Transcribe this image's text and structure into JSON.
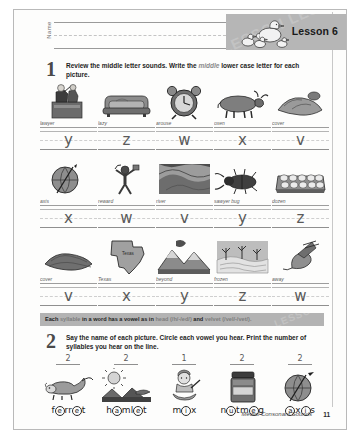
{
  "header": {
    "name_label": "Name",
    "lesson_title": "Lesson 6",
    "banner_watermark": "LESSON LESSON LESSON",
    "duck_icon": "duck-with-ducklings-icon"
  },
  "section1": {
    "number": "1",
    "instruction_prefix": "Review the middle letter sounds. Write the ",
    "instruction_emphasis": "middle",
    "instruction_suffix": " lower case letter for each picture.",
    "rows": [
      {
        "cells": [
          {
            "word": "lawyer",
            "answer": "y",
            "art": "lawyer-icon"
          },
          {
            "word": "lazy",
            "answer": "z",
            "art": "sofa-icon"
          },
          {
            "word": "arouse",
            "answer": "w",
            "art": "alarm-clock-icon"
          },
          {
            "word": "oxen",
            "answer": "x",
            "art": "oxen-icon"
          },
          {
            "word": "cover",
            "answer": "v",
            "art": "cover-icon"
          }
        ]
      },
      {
        "cells": [
          {
            "word": "axis",
            "answer": "x",
            "art": "globe-axis-icon"
          },
          {
            "word": "reward",
            "answer": "w",
            "art": "reward-icon"
          },
          {
            "word": "river",
            "answer": "v",
            "art": "river-icon"
          },
          {
            "word": "sawyer bug",
            "answer": "y",
            "art": "beetle-icon"
          },
          {
            "word": "dozen",
            "answer": "z",
            "art": "egg-carton-icon"
          }
        ]
      },
      {
        "cells": [
          {
            "word": "cover",
            "answer": "v",
            "art": "blanket-icon"
          },
          {
            "word": "Texas",
            "answer": "x",
            "art": "texas-map-icon"
          },
          {
            "word": "beyond",
            "answer": "y",
            "art": "mountains-icon"
          },
          {
            "word": "frozen",
            "answer": "z",
            "art": "frozen-lake-icon"
          },
          {
            "word": "away",
            "answer": "w",
            "art": "bird-flying-away-icon"
          }
        ]
      }
    ]
  },
  "tip": {
    "prefix": "Each ",
    "word1": "syllable",
    "middle": " in a word has a vowel as in ",
    "word2": "head",
    "phon1": " (/h/-/ed/) ",
    "and": "and",
    "word3": " velvet",
    "phon2": " (/vel/-/vet/).",
    "watermark": "LESSON"
  },
  "section2": {
    "number": "2",
    "instruction_line1": "Say the name of each picture. Circle each vowel you hear. Print the number of",
    "instruction_line2": "syllables you hear on the line.",
    "cells": [
      {
        "count": "2",
        "art": "ferret-icon",
        "parts": [
          {
            "t": "f",
            "c": false
          },
          {
            "t": "e",
            "c": true
          },
          {
            "t": "rr",
            "c": false
          },
          {
            "t": "e",
            "c": true
          },
          {
            "t": "t",
            "c": false
          }
        ]
      },
      {
        "count": "2",
        "art": "hamlet-icon",
        "parts": [
          {
            "t": "h",
            "c": false
          },
          {
            "t": "a",
            "c": true
          },
          {
            "t": "m",
            "c": false
          },
          {
            "t": "l",
            "c": false
          },
          {
            "t": "e",
            "c": true
          },
          {
            "t": "t",
            "c": false
          }
        ]
      },
      {
        "count": "1",
        "art": "mix-icon",
        "parts": [
          {
            "t": "m",
            "c": false
          },
          {
            "t": "i",
            "c": true
          },
          {
            "t": "x",
            "c": false
          }
        ]
      },
      {
        "count": "2",
        "art": "nutmeg-jar-icon",
        "parts": [
          {
            "t": "n",
            "c": false
          },
          {
            "t": "u",
            "c": true
          },
          {
            "t": "t",
            "c": false
          },
          {
            "t": "m",
            "c": false
          },
          {
            "t": "e",
            "c": true
          },
          {
            "t": "g",
            "c": false
          }
        ]
      },
      {
        "count": "2",
        "art": "axis-globe-icon",
        "parts": [
          {
            "t": "a",
            "c": true
          },
          {
            "t": "x",
            "c": false
          },
          {
            "t": "i",
            "c": true
          },
          {
            "t": "s",
            "c": false
          }
        ]
      }
    ]
  },
  "footer": {
    "title": "Medial Consonant Sounds",
    "page": "11"
  }
}
